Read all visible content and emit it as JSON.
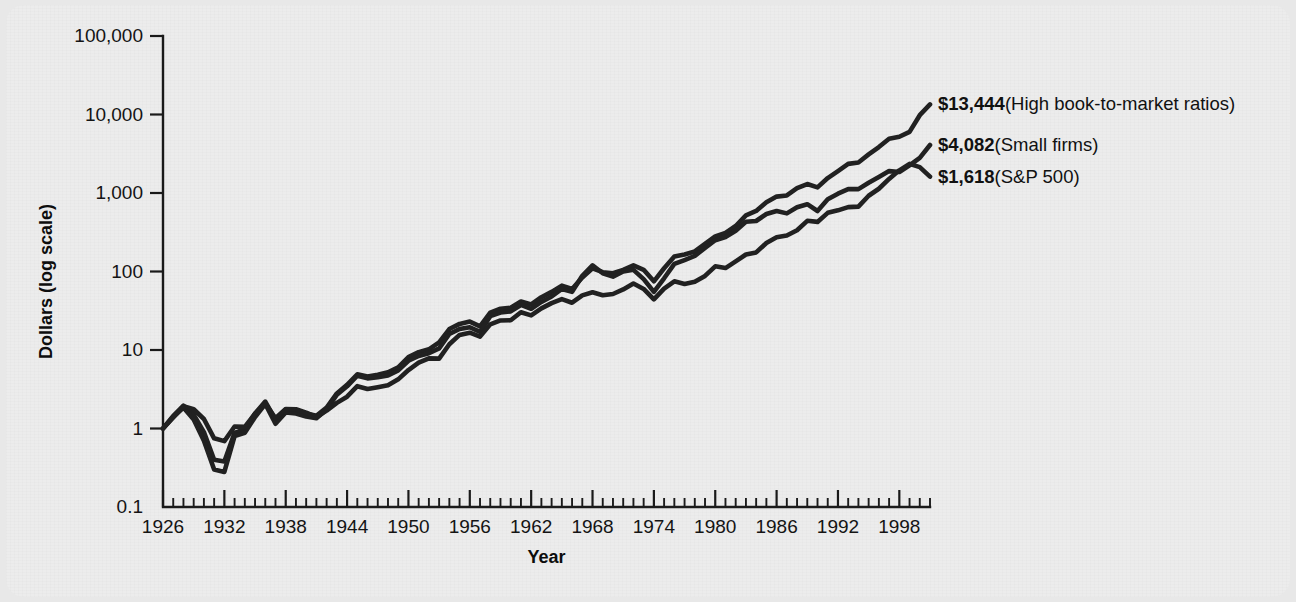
{
  "chart_data": {
    "type": "line",
    "title": "",
    "xlabel": "Year",
    "ylabel": "Dollars (log scale)",
    "yscale": "log",
    "ylim": [
      0.1,
      100000
    ],
    "xlim": [
      1926,
      2001
    ],
    "grid": false,
    "legend_position": "right-end-labels",
    "ytick_labels": [
      "100,000",
      "10,000",
      "1,000",
      "100",
      "10",
      "1",
      "0.1"
    ],
    "ytick_values": [
      100000,
      10000,
      1000,
      100,
      10,
      1,
      0.1
    ],
    "xtick_labels": [
      "1926",
      "1932",
      "1938",
      "1944",
      "1950",
      "1956",
      "1962",
      "1968",
      "1974",
      "1980",
      "1986",
      "1992",
      "1998"
    ],
    "xtick_values": [
      1926,
      1932,
      1938,
      1944,
      1950,
      1956,
      1962,
      1968,
      1974,
      1980,
      1986,
      1992,
      1998
    ],
    "x_minor_tick_interval": 1,
    "x": [
      1926,
      1927,
      1928,
      1929,
      1930,
      1931,
      1932,
      1933,
      1934,
      1935,
      1936,
      1937,
      1938,
      1939,
      1940,
      1941,
      1942,
      1943,
      1944,
      1945,
      1946,
      1947,
      1948,
      1949,
      1950,
      1951,
      1952,
      1953,
      1954,
      1955,
      1956,
      1957,
      1958,
      1959,
      1960,
      1961,
      1962,
      1963,
      1964,
      1965,
      1966,
      1967,
      1968,
      1969,
      1970,
      1971,
      1972,
      1973,
      1974,
      1975,
      1976,
      1977,
      1978,
      1979,
      1980,
      1981,
      1982,
      1983,
      1984,
      1985,
      1986,
      1987,
      1988,
      1989,
      1990,
      1991,
      1992,
      1993,
      1994,
      1995,
      1996,
      1997,
      1998,
      1999,
      2000,
      2001
    ],
    "series": [
      {
        "name": "High book-to-market ratios",
        "end_value": 13444,
        "end_label": "$13,444",
        "end_label_paren": "(High book-to-market ratios)",
        "color": "#212121",
        "values": [
          1.0,
          1.45,
          1.95,
          1.5,
          0.9,
          0.4,
          0.38,
          0.88,
          0.98,
          1.55,
          2.2,
          1.3,
          1.75,
          1.7,
          1.55,
          1.45,
          1.85,
          2.8,
          3.6,
          4.9,
          4.6,
          4.85,
          5.2,
          6.0,
          8.1,
          9.4,
          10.2,
          12.5,
          18.5,
          21.5,
          23.0,
          20.0,
          30.0,
          33.5,
          34.5,
          41.5,
          38.0,
          47.0,
          55.0,
          66.0,
          60.0,
          84.0,
          110.0,
          98.0,
          95.0,
          105.0,
          120.0,
          105.0,
          75.0,
          110.0,
          155.0,
          165.0,
          180.0,
          225.0,
          280.0,
          310.0,
          380.0,
          520.0,
          590.0,
          760.0,
          900.0,
          930.0,
          1150.0,
          1300.0,
          1180.0,
          1550.0,
          1900.0,
          2350.0,
          2450.0,
          3100.0,
          3850.0,
          4900.0,
          5200.0,
          6000.0,
          9800.0,
          13444.0
        ]
      },
      {
        "name": "Small firms",
        "end_value": 4082,
        "end_label": "$4,082",
        "end_label_paren": "(Small firms)",
        "color": "#212121",
        "values": [
          1.0,
          1.4,
          1.85,
          1.3,
          0.7,
          0.3,
          0.28,
          0.8,
          0.88,
          1.4,
          2.05,
          1.15,
          1.6,
          1.55,
          1.42,
          1.35,
          1.75,
          2.7,
          3.45,
          4.7,
          4.35,
          4.5,
          4.75,
          5.5,
          7.3,
          8.4,
          9.1,
          10.5,
          16.0,
          18.5,
          19.5,
          17.0,
          27.0,
          30.0,
          31.0,
          37.5,
          33.5,
          41.0,
          48.0,
          60.0,
          55.0,
          88.0,
          120.0,
          95.0,
          86.0,
          100.0,
          105.0,
          80.0,
          55.0,
          82.0,
          125.0,
          140.0,
          158.0,
          200.0,
          250.0,
          275.0,
          330.0,
          430.0,
          440.0,
          540.0,
          590.0,
          550.0,
          660.0,
          720.0,
          590.0,
          830.0,
          980.0,
          1120.0,
          1120.0,
          1350.0,
          1600.0,
          1900.0,
          1850.0,
          2250.0,
          2800.0,
          4082.0
        ]
      },
      {
        "name": "S&P 500",
        "end_value": 1618,
        "end_label": "$1,618",
        "end_label_paren": "(S&P 500)",
        "color": "#212121",
        "values": [
          1.0,
          1.38,
          1.92,
          1.76,
          1.32,
          0.75,
          0.69,
          1.06,
          1.05,
          1.55,
          2.08,
          1.35,
          1.77,
          1.76,
          1.59,
          1.4,
          1.69,
          2.12,
          2.54,
          3.46,
          3.18,
          3.36,
          3.55,
          4.23,
          5.56,
          6.9,
          7.83,
          7.76,
          11.84,
          15.58,
          16.6,
          14.8,
          21.23,
          23.8,
          23.9,
          30.3,
          27.65,
          33.95,
          39.55,
          44.5,
          40.0,
          49.6,
          54.35,
          49.75,
          51.7,
          59.1,
          70.3,
          60.0,
          44.1,
          60.5,
          74.9,
          69.5,
          74.1,
          87.8,
          116.3,
          110.6,
          134.4,
          164.7,
          175.1,
          230.7,
          273.5,
          288.0,
          335.8,
          442.0,
          428.3,
          558.7,
          601.2,
          661.6,
          670.2,
          922.0,
          1133.0,
          1511.0,
          1943.0,
          2352.0,
          2137.0,
          1618.0
        ]
      }
    ]
  },
  "annotations": [
    {
      "id": "ann-high-bm",
      "bold": "$13,444",
      "rest": " (High book-to-market ratios)"
    },
    {
      "id": "ann-small",
      "bold": "$4,082",
      "rest": " (Small firms)"
    },
    {
      "id": "ann-sp500",
      "bold": "$1,618",
      "rest": " (S&P 500)"
    }
  ]
}
